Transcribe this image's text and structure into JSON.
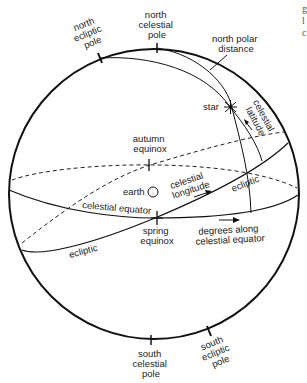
{
  "diagram": {
    "colors": {
      "line": "#111111",
      "text": "#222222",
      "background": "#ffffff"
    },
    "labels": {
      "north_ecliptic_pole": [
        "north",
        "ecliptic",
        "pole"
      ],
      "north_celestial_pole": [
        "north",
        "celestial",
        "pole"
      ],
      "north_polar_distance": [
        "north polar",
        "distance"
      ],
      "star": "star",
      "celestial_latitude": [
        "celestial",
        "latitude"
      ],
      "autumn_equinox": [
        "autumn",
        "equinox"
      ],
      "earth": "earth",
      "celestial_longitude": [
        "celestial",
        "longitude"
      ],
      "ecliptic_right": "ecliptic",
      "celestial_equator": "celestial equator",
      "spring_equinox": [
        "spring",
        "equinox"
      ],
      "degrees_along": [
        "degrees along",
        "celestial equator"
      ],
      "ecliptic_left": "ecliptic",
      "south_celestial_pole": [
        "south",
        "celestial",
        "pole"
      ],
      "south_ecliptic_pole": [
        "south",
        "ecliptic",
        "pole"
      ]
    },
    "edge_fragments": [
      "g",
      "l",
      "c"
    ]
  }
}
